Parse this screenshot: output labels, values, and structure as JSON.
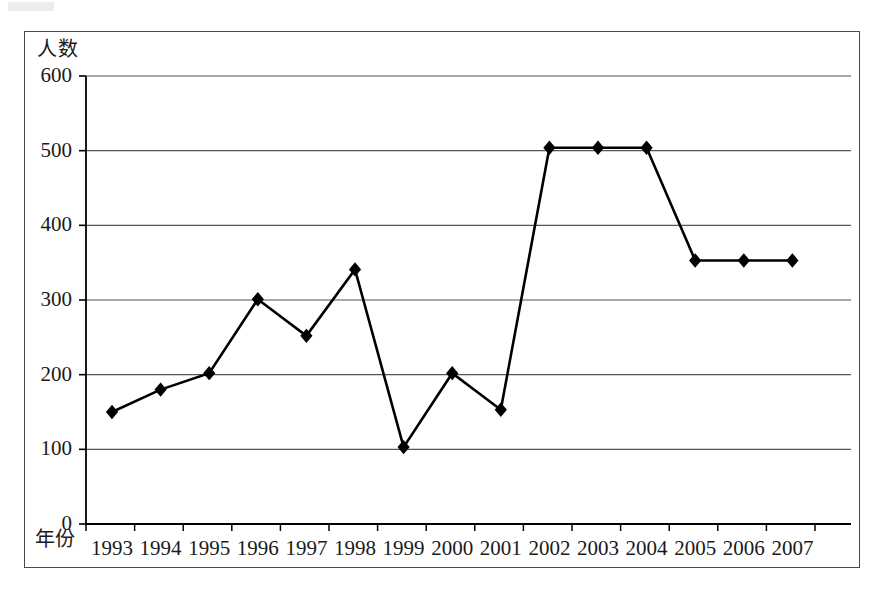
{
  "chart_data": {
    "type": "line",
    "title": "",
    "subtitle": "",
    "xlabel": "年份",
    "ylabel": "人数",
    "categories": [
      "1993",
      "1994",
      "1995",
      "1996",
      "1997",
      "1998",
      "1999",
      "2000",
      "2001",
      "2002",
      "2003",
      "2004",
      "2005",
      "2006",
      "2007"
    ],
    "values": [
      150,
      180,
      202,
      301,
      252,
      341,
      103,
      202,
      153,
      504,
      504,
      504,
      353,
      353,
      353
    ],
    "series": [
      {
        "name": "人数",
        "values": [
          150,
          180,
          202,
          301,
          252,
          341,
          103,
          202,
          153,
          504,
          504,
          504,
          353,
          353,
          353
        ]
      }
    ],
    "ylim": [
      0,
      600
    ],
    "ytick_labels": [
      "0",
      "100",
      "200",
      "300",
      "400",
      "500",
      "600"
    ],
    "ytick_values": [
      0,
      100,
      200,
      300,
      400,
      500,
      600
    ],
    "grid": "horizontal",
    "legend": "none",
    "marker": "diamond",
    "line_color": "#000000",
    "marker_color": "#000000",
    "grid_color": "#555555",
    "axis_color": "#000000",
    "frame_color": "#4a4a4a"
  }
}
